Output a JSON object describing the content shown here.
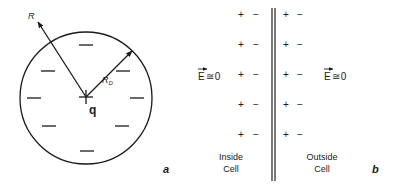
{
  "panel_a": {
    "label": "a",
    "charge_label": "q",
    "radius_label": "R",
    "debye_label_main": "R",
    "debye_label_sub": "D",
    "center_symbol": "+",
    "inner_charges": [
      "−",
      "−",
      "−",
      "−",
      "−",
      "−",
      "−",
      "−",
      "−"
    ]
  },
  "panel_b": {
    "label": "b",
    "field_left": {
      "vector": "E",
      "relation": "≅",
      "value": "0"
    },
    "field_right": {
      "vector": "E",
      "relation": "≅",
      "value": "0"
    },
    "rows": [
      {
        "left": [
          "+",
          "−"
        ],
        "right": [
          "+",
          "−"
        ]
      },
      {
        "left": [
          "+",
          "−"
        ],
        "right": [
          "+",
          "−"
        ]
      },
      {
        "left": [
          "+",
          "−"
        ],
        "right": [
          "+",
          "−"
        ]
      },
      {
        "left": [
          "+",
          "−"
        ],
        "right": [
          "+",
          "−"
        ]
      },
      {
        "left": [
          "+",
          "−"
        ],
        "right": [
          "+",
          "−"
        ]
      }
    ],
    "inside_label": [
      "Inside",
      "Cell"
    ],
    "outside_label": [
      "Outside",
      "Cell"
    ]
  },
  "colors": {
    "ink": "#1a1a1a",
    "membrane": "#333333"
  }
}
